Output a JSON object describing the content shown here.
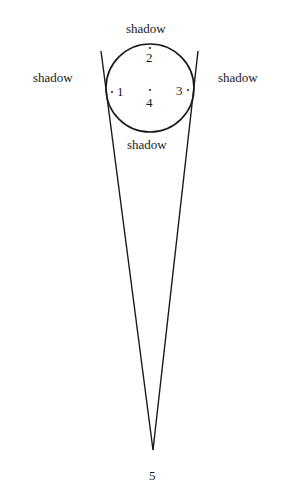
{
  "diagram": {
    "labels": {
      "shadow_top": "shadow",
      "shadow_left": "shadow",
      "shadow_right": "shadow",
      "shadow_bottom": "shadow"
    },
    "points": {
      "p1": "1",
      "p2": "2",
      "p3": "3",
      "p4": "4",
      "p5": "5"
    },
    "circle": {
      "cx": 150,
      "cy": 88,
      "r": 44
    },
    "apex": {
      "x": 153,
      "y": 450
    },
    "colors": {
      "ink": "#1a1a1a",
      "background": "#ffffff"
    }
  }
}
